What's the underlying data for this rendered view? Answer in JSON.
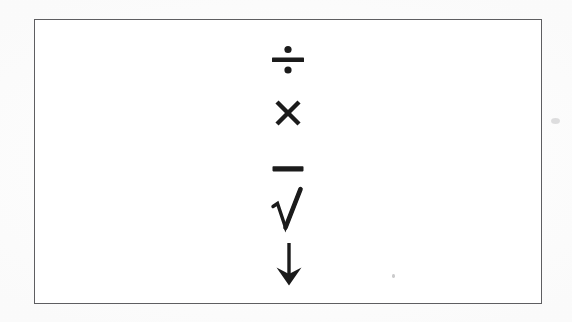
{
  "document": {
    "kind": "scanned-worksheet-card",
    "page_background": "#ffffff",
    "ink_color": "#1b1b1b",
    "frame_color": "#4a4a4c"
  },
  "frame": {
    "label": "symbol box",
    "x": 34,
    "y": 19,
    "width": 508,
    "height": 285
  },
  "symbols": [
    {
      "id": "division-sign",
      "glyph": "÷",
      "name": "division sign",
      "order": 1,
      "x": 287,
      "y": 59
    },
    {
      "id": "multiplication-sign",
      "glyph": "×",
      "name": "multiplication sign",
      "order": 2,
      "x": 287,
      "y": 112
    },
    {
      "id": "minus-sign",
      "glyph": "−",
      "name": "minus sign",
      "order": 3,
      "x": 287,
      "y": 168
    },
    {
      "id": "square-root-sign",
      "glyph": "√",
      "name": "square root radical",
      "order": 4,
      "x": 288,
      "y": 209
    },
    {
      "id": "down-arrow",
      "glyph": "↓",
      "name": "downwards arrow",
      "order": 5,
      "x": 288,
      "y": 263
    }
  ],
  "artifacts": [
    {
      "id": "speck-inner",
      "name": "scan speck inside frame"
    },
    {
      "id": "speck-outer",
      "name": "scan smudge outside frame"
    }
  ]
}
